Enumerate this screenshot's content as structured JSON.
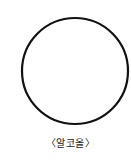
{
  "figure": {
    "shape": "circle",
    "circle": {
      "cx": 75,
      "cy": 71,
      "r": 53,
      "stroke": "#111111",
      "stroke_width": 2.2,
      "fill": "#ffffff"
    },
    "caption": "〈알코올〉"
  }
}
